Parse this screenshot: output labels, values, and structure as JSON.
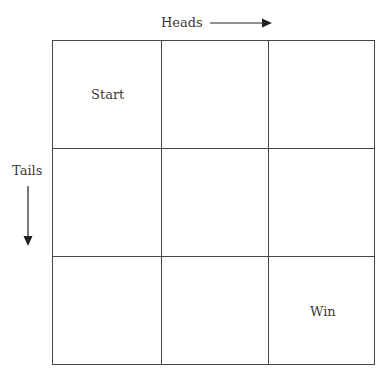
{
  "diagram": {
    "axis_x_label": "Heads",
    "axis_y_label": "Tails",
    "grid": {
      "rows": 3,
      "cols": 3
    },
    "cells": {
      "start": {
        "label": "Start",
        "row": 0,
        "col": 0
      },
      "win": {
        "label": "Win",
        "row": 2,
        "col": 2
      }
    },
    "icons": {
      "heads_arrow": "arrow-right",
      "tails_arrow": "arrow-down"
    }
  }
}
